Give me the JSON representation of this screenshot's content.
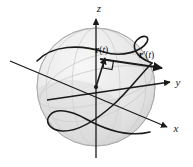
{
  "figure": {
    "background_color": "#ffffff",
    "ink_color": "#1a1a1a",
    "sphere_fill": "#e8e8e8",
    "sphere_outline": "#b5b5b5",
    "grid_color": "#cfcfcf"
  },
  "axes": {
    "z": {
      "label": "z",
      "direction": "up"
    },
    "y": {
      "label": "y",
      "direction": "right"
    },
    "x": {
      "label": "x",
      "direction": "lower-right"
    }
  },
  "vectors": {
    "position": {
      "name": "r(t)",
      "bold_part": "r",
      "paren_open": "(",
      "var": "t",
      "paren_close": ")",
      "prime": ""
    },
    "tangent": {
      "name": "r'(t)",
      "bold_part": "r",
      "prime": "′",
      "paren_open": "(",
      "var": "t",
      "paren_close": ")"
    }
  },
  "markers": {
    "right_angle": "right-angle-symbol",
    "origin": "origin-dot"
  },
  "curve": {
    "description": "space curve traced on sphere surface"
  }
}
